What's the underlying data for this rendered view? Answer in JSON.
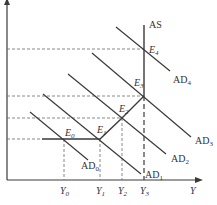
{
  "diagram": {
    "type": "AD-AS model",
    "axes": {
      "x_label": "Y",
      "y_label": ""
    },
    "colors": {
      "line": "#3a3a3a",
      "dashed": "#6a6a6a",
      "background": "#ffffff"
    },
    "curves": {
      "as": {
        "label": "AS"
      },
      "ad": [
        {
          "label": "AD",
          "sub": "0"
        },
        {
          "label": "AD",
          "sub": "1"
        },
        {
          "label": "AD",
          "sub": "2"
        },
        {
          "label": "AD",
          "sub": "3"
        },
        {
          "label": "AD",
          "sub": "4"
        }
      ]
    },
    "equilibria": [
      {
        "label": "E",
        "sub": "0"
      },
      {
        "label": "E",
        "sub": "1"
      },
      {
        "label": "E",
        "sub": "2"
      },
      {
        "label": "E",
        "sub": "3"
      },
      {
        "label": "E",
        "sub": "4"
      }
    ],
    "x_ticks": [
      {
        "label": "Y",
        "sub": "0"
      },
      {
        "label": "Y",
        "sub": "1"
      },
      {
        "label": "Y",
        "sub": "2"
      },
      {
        "label": "Y",
        "sub": "3"
      }
    ]
  }
}
